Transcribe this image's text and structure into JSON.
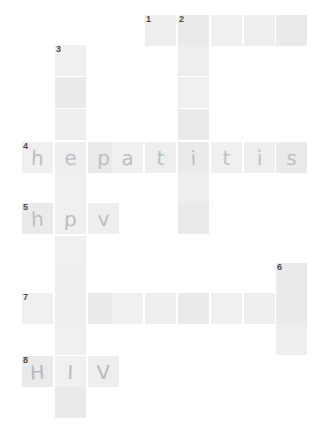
{
  "puzzle": {
    "title": "crossword-grid",
    "cell_size": 31,
    "cell_pitch_x": 33,
    "cell_color": "#ededed",
    "page_background": "#ffffff",
    "letter_color": "#bcbfc4",
    "number_color": "#4a4a4a",
    "clue_numbers": [
      "1",
      "2",
      "3",
      "4",
      "5",
      "6",
      "7",
      "8"
    ],
    "cells": [
      {
        "id": "r0c4",
        "x": 145,
        "y": 15,
        "number": "1",
        "letter": ""
      },
      {
        "id": "r0c5",
        "x": 178,
        "y": 15,
        "number": "2",
        "letter": ""
      },
      {
        "id": "r0c6",
        "x": 211,
        "y": 15,
        "number": "",
        "letter": ""
      },
      {
        "id": "r0c7",
        "x": 244,
        "y": 15,
        "number": "",
        "letter": ""
      },
      {
        "id": "r0c8",
        "x": 276,
        "y": 15,
        "number": "",
        "letter": ""
      },
      {
        "id": "r1c1",
        "x": 55,
        "y": 45,
        "number": "3",
        "letter": ""
      },
      {
        "id": "r1c5",
        "x": 178,
        "y": 45,
        "number": "",
        "letter": ""
      },
      {
        "id": "r2c1",
        "x": 55,
        "y": 77,
        "number": "",
        "letter": ""
      },
      {
        "id": "r2c5",
        "x": 178,
        "y": 77,
        "number": "",
        "letter": ""
      },
      {
        "id": "r3c1",
        "x": 55,
        "y": 109,
        "number": "",
        "letter": ""
      },
      {
        "id": "r3c5",
        "x": 178,
        "y": 109,
        "number": "",
        "letter": ""
      },
      {
        "id": "r4c0",
        "x": 22,
        "y": 142,
        "number": "4",
        "letter": "h"
      },
      {
        "id": "r4c1",
        "x": 55,
        "y": 142,
        "number": "",
        "letter": "e"
      },
      {
        "id": "r4c2",
        "x": 88,
        "y": 142,
        "number": "",
        "letter": "p"
      },
      {
        "id": "r4c3",
        "x": 112,
        "y": 142,
        "number": "",
        "letter": "a"
      },
      {
        "id": "r4c4",
        "x": 145,
        "y": 142,
        "number": "",
        "letter": "t"
      },
      {
        "id": "r4c5",
        "x": 178,
        "y": 142,
        "number": "",
        "letter": "i"
      },
      {
        "id": "r4c6",
        "x": 211,
        "y": 142,
        "number": "",
        "letter": "t"
      },
      {
        "id": "r4c7",
        "x": 244,
        "y": 142,
        "number": "",
        "letter": "i"
      },
      {
        "id": "r4c8",
        "x": 276,
        "y": 142,
        "number": "",
        "letter": "s"
      },
      {
        "id": "r5c1",
        "x": 55,
        "y": 172,
        "number": "",
        "letter": ""
      },
      {
        "id": "r5c5",
        "x": 178,
        "y": 172,
        "number": "",
        "letter": ""
      },
      {
        "id": "r6c0",
        "x": 22,
        "y": 203,
        "number": "5",
        "letter": "h"
      },
      {
        "id": "r6c1",
        "x": 55,
        "y": 203,
        "number": "",
        "letter": "p"
      },
      {
        "id": "r6c2",
        "x": 88,
        "y": 203,
        "number": "",
        "letter": "v"
      },
      {
        "id": "r6c5",
        "x": 178,
        "y": 203,
        "number": "",
        "letter": ""
      },
      {
        "id": "r7c1",
        "x": 55,
        "y": 236,
        "number": "",
        "letter": ""
      },
      {
        "id": "r8c1",
        "x": 55,
        "y": 263,
        "number": "",
        "letter": ""
      },
      {
        "id": "r8c8",
        "x": 276,
        "y": 263,
        "number": "6",
        "letter": ""
      },
      {
        "id": "r9c0",
        "x": 22,
        "y": 293,
        "number": "7",
        "letter": ""
      },
      {
        "id": "r9c1",
        "x": 55,
        "y": 293,
        "number": "",
        "letter": ""
      },
      {
        "id": "r9c2",
        "x": 88,
        "y": 293,
        "number": "",
        "letter": ""
      },
      {
        "id": "r9c3",
        "x": 112,
        "y": 293,
        "number": "",
        "letter": ""
      },
      {
        "id": "r9c4",
        "x": 145,
        "y": 293,
        "number": "",
        "letter": ""
      },
      {
        "id": "r9c5",
        "x": 178,
        "y": 293,
        "number": "",
        "letter": ""
      },
      {
        "id": "r9c6",
        "x": 211,
        "y": 293,
        "number": "",
        "letter": ""
      },
      {
        "id": "r9c7",
        "x": 244,
        "y": 293,
        "number": "",
        "letter": ""
      },
      {
        "id": "r9c8",
        "x": 276,
        "y": 293,
        "number": "",
        "letter": ""
      },
      {
        "id": "r10c1",
        "x": 55,
        "y": 324,
        "number": "",
        "letter": ""
      },
      {
        "id": "r10c8",
        "x": 276,
        "y": 324,
        "number": "",
        "letter": ""
      },
      {
        "id": "r11c0",
        "x": 22,
        "y": 356,
        "number": "8",
        "letter": "H"
      },
      {
        "id": "r11c1",
        "x": 55,
        "y": 356,
        "number": "",
        "letter": "I"
      },
      {
        "id": "r11c2",
        "x": 88,
        "y": 356,
        "number": "",
        "letter": "V"
      },
      {
        "id": "r12c1",
        "x": 55,
        "y": 387,
        "number": "",
        "letter": ""
      }
    ]
  }
}
